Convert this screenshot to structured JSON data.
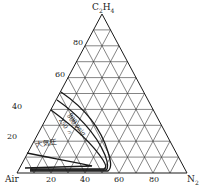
{
  "vertices": {
    "top": {
      "label": "C",
      "sub1": "2",
      "mid": "H",
      "sub2": "4"
    },
    "left": {
      "label": "Air"
    },
    "right": {
      "label": "N",
      "sub": "2"
    }
  },
  "left_ticks": [
    "20",
    "40",
    "60",
    "80"
  ],
  "bottom_ticks": [
    "20",
    "40",
    "60",
    "80"
  ],
  "curves": [
    {
      "label": "900 psig"
    },
    {
      "label": "500 〃"
    },
    {
      "label": "250 〃"
    },
    {
      "label": "大気圧"
    }
  ],
  "colors": {
    "line": "#1a1a1a",
    "grid": "#333333"
  }
}
